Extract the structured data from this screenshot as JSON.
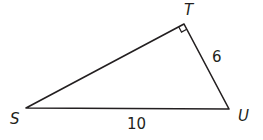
{
  "diagram": {
    "type": "right-triangle",
    "vertices": {
      "S": {
        "label": "S",
        "x": 26,
        "y": 108
      },
      "T": {
        "label": "T",
        "x": 184,
        "y": 24
      },
      "U": {
        "label": "U",
        "x": 229,
        "y": 109
      }
    },
    "right_angle_at": "T",
    "sides": {
      "TU": {
        "label": "6"
      },
      "SU": {
        "label": "10"
      }
    },
    "stroke_color": "#231f20"
  }
}
